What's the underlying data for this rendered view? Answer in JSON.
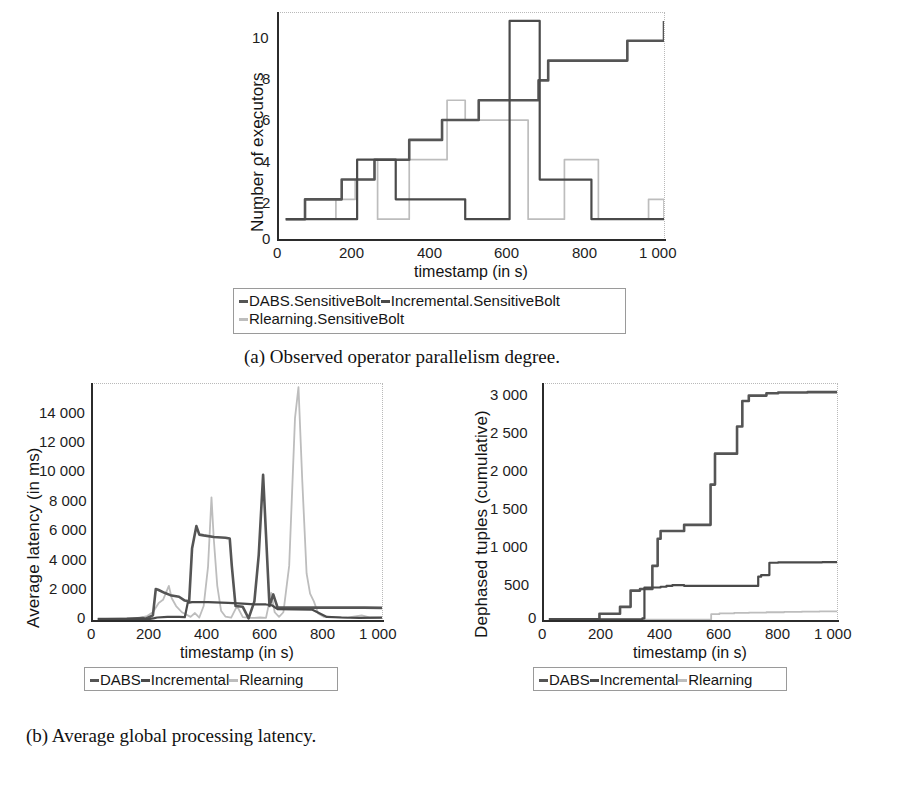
{
  "figure": {
    "panels": [
      {
        "id": "a",
        "caption": "(a) Observed operator parallelism degree.",
        "legend": [
          {
            "label": "DABS.SensitiveBolt",
            "color": "#555555"
          },
          {
            "label": "Incremental.SensitiveBolt",
            "color": "#4a4a4a"
          },
          {
            "label": "Rlearning.SensitiveBolt",
            "color": "#bdbdbd"
          }
        ]
      },
      {
        "id": "b",
        "caption": "(b) Average global processing latency.",
        "legend": [
          {
            "label": "DABS",
            "color": "#555555"
          },
          {
            "label": "Incremental",
            "color": "#4a4a4a"
          },
          {
            "label": "Rlearning",
            "color": "#bdbdbd"
          }
        ]
      },
      {
        "id": "c",
        "caption": "(c) Cumulated dephased tuples.",
        "legend": [
          {
            "label": "DABS",
            "color": "#555555"
          },
          {
            "label": "Incremental",
            "color": "#4a4a4a"
          },
          {
            "label": "Rlearning",
            "color": "#bdbdbd"
          }
        ]
      }
    ]
  },
  "chart_data": [
    {
      "panel": "a",
      "type": "line",
      "title": "",
      "xlabel": "timestamp (in s)",
      "ylabel": "Number of executors",
      "xlim": [
        0,
        1000
      ],
      "ylim": [
        0,
        11.4
      ],
      "xticks": [
        0,
        200,
        400,
        600,
        800,
        1000
      ],
      "xticklabels": [
        "0",
        "200",
        "400",
        "600",
        "800",
        "1 000"
      ],
      "yticks": [
        0,
        2,
        4,
        6,
        8,
        10
      ],
      "yticklabels": [
        "0",
        "2",
        "4",
        "6",
        "8",
        "10"
      ],
      "grid": false,
      "legend_position": "below-plot",
      "step": true,
      "series": [
        {
          "name": "DABS.SensitiveBolt",
          "color": "#555555",
          "x": [
            20,
            45,
            70,
            140,
            165,
            195,
            250,
            285,
            310,
            340,
            370,
            425,
            455,
            480,
            520,
            545,
            595,
            600,
            660,
            675,
            690,
            700,
            730,
            790,
            810,
            880,
            905,
            1000
          ],
          "y": [
            1,
            1,
            2,
            2,
            3,
            3,
            4,
            4,
            4,
            5,
            5,
            6,
            6,
            6,
            7,
            7,
            7,
            7,
            7,
            8,
            8,
            9,
            9,
            9,
            9,
            9,
            10,
            11
          ]
        },
        {
          "name": "Incremental.SensitiveBolt",
          "color": "#4a4a4a",
          "x": [
            20,
            200,
            205,
            255,
            260,
            300,
            305,
            480,
            485,
            595,
            600,
            672,
            678,
            700,
            800,
            812,
            1000
          ],
          "y": [
            1,
            1,
            4,
            4,
            4,
            4,
            2,
            2,
            1,
            1,
            11,
            11,
            3,
            3,
            3,
            1,
            1
          ]
        },
        {
          "name": "Rlearning.SensitiveBolt",
          "color": "#bdbdbd",
          "x": [
            20,
            115,
            150,
            195,
            200,
            225,
            250,
            258,
            330,
            340,
            430,
            438,
            478,
            485,
            545,
            552,
            640,
            648,
            735,
            742,
            822,
            830,
            940,
            960,
            985,
            1000
          ],
          "y": [
            1,
            1,
            2,
            2,
            3,
            3,
            4,
            1,
            1,
            4,
            4,
            7,
            7,
            6,
            6,
            6,
            6,
            1,
            1,
            4,
            4,
            1,
            1,
            2,
            2,
            1
          ]
        }
      ]
    },
    {
      "panel": "b",
      "type": "line",
      "title": "",
      "xlabel": "timestamp (in s)",
      "ylabel": "Average latency (in ms)",
      "xlim": [
        0,
        1000
      ],
      "ylim": [
        0,
        15200
      ],
      "xticks": [
        0,
        200,
        400,
        600,
        800,
        1000
      ],
      "xticklabels": [
        "0",
        "200",
        "400",
        "600",
        "800",
        "1 000"
      ],
      "yticks": [
        0,
        2000,
        4000,
        6000,
        8000,
        10000,
        12000,
        14000
      ],
      "yticklabels": [
        "0",
        "2 000",
        "4 000",
        "6 000",
        "8 000",
        "10 000",
        "12 000",
        "14 000"
      ],
      "grid": false,
      "legend_position": "below-plot",
      "series": [
        {
          "name": "DABS",
          "color": "#555555",
          "x": [
            20,
            120,
            175,
            185,
            210,
            220,
            228,
            250,
            270,
            300,
            320,
            335,
            345,
            360,
            370,
            385,
            420,
            460,
            475,
            482,
            495,
            520,
            540,
            560,
            575,
            590,
            600,
            612,
            625,
            640,
            700,
            780,
            860,
            940,
            1000
          ],
          "y": [
            60,
            70,
            120,
            80,
            300,
            2000,
            1950,
            1750,
            1600,
            1500,
            1250,
            1200,
            4600,
            6050,
            5500,
            5450,
            5350,
            5300,
            5250,
            3500,
            900,
            850,
            100,
            1200,
            4200,
            9350,
            5500,
            900,
            1650,
            800,
            800,
            800,
            800,
            800,
            780
          ]
        },
        {
          "name": "Incremental",
          "color": "#4a4a4a",
          "x": [
            20,
            150,
            200,
            215,
            225,
            260,
            300,
            320,
            330,
            345,
            400,
            470,
            520,
            560,
            600,
            620,
            640,
            700,
            760,
            810,
            860,
            920,
            1000
          ],
          "y": [
            50,
            60,
            70,
            120,
            160,
            200,
            200,
            180,
            1100,
            1150,
            1150,
            1100,
            1050,
            1000,
            1000,
            950,
            700,
            680,
            660,
            200,
            160,
            140,
            150
          ]
        },
        {
          "name": "Rlearning",
          "color": "#bdbdbd",
          "x": [
            20,
            100,
            160,
            190,
            210,
            230,
            245,
            265,
            275,
            290,
            310,
            340,
            355,
            370,
            385,
            400,
            412,
            420,
            432,
            445,
            460,
            480,
            500,
            520,
            545,
            560,
            580,
            600,
            618,
            630,
            645,
            660,
            680,
            700,
            712,
            725,
            740,
            752,
            765,
            780,
            800,
            840,
            880,
            930,
            960,
            1000
          ],
          "y": [
            60,
            100,
            120,
            250,
            500,
            1100,
            1300,
            2200,
            1400,
            900,
            500,
            200,
            450,
            160,
            900,
            3400,
            7900,
            5200,
            2200,
            600,
            220,
            150,
            900,
            180,
            140,
            140,
            160,
            140,
            1750,
            500,
            200,
            500,
            3500,
            13000,
            15000,
            9000,
            3000,
            1700,
            1200,
            420,
            200,
            180,
            160,
            300,
            160,
            150
          ]
        }
      ]
    },
    {
      "panel": "c",
      "type": "line",
      "title": "",
      "xlabel": "timestamp (in s)",
      "ylabel": "Dephased tuples (cumulative)",
      "xlim": [
        0,
        1000
      ],
      "ylim": [
        0,
        3050
      ],
      "xticks": [
        0,
        200,
        400,
        600,
        800,
        1000
      ],
      "xticklabels": [
        "0",
        "200",
        "400",
        "600",
        "800",
        "1 000"
      ],
      "yticks": [
        0,
        500,
        1000,
        1500,
        2000,
        2500,
        3000
      ],
      "yticklabels": [
        "0",
        "500",
        "1 000",
        "1 500",
        "2 000",
        "2 500",
        "3 000"
      ],
      "grid": false,
      "legend_position": "below-plot",
      "step": true,
      "series": [
        {
          "name": "DABS",
          "color": "#555555",
          "x": [
            20,
            185,
            192,
            255,
            262,
            290,
            298,
            320,
            330,
            360,
            372,
            390,
            400,
            470,
            480,
            560,
            570,
            585,
            650,
            660,
            678,
            700,
            760,
            800,
            900,
            1000
          ],
          "y": [
            10,
            10,
            80,
            80,
            170,
            170,
            380,
            380,
            400,
            400,
            700,
            1050,
            1150,
            1150,
            1230,
            1230,
            1750,
            2150,
            2150,
            2500,
            2830,
            2900,
            2930,
            2940,
            2945,
            2950
          ]
        },
        {
          "name": "Incremental",
          "color": "#4a4a4a",
          "x": [
            20,
            330,
            338,
            345,
            390,
            400,
            420,
            440,
            460,
            480,
            560,
            640,
            720,
            732,
            742,
            760,
            770,
            800,
            880,
            950,
            1000
          ],
          "y": [
            8,
            8,
            20,
            420,
            420,
            430,
            440,
            450,
            450,
            440,
            440,
            440,
            440,
            560,
            580,
            580,
            740,
            745,
            745,
            748,
            750
          ]
        },
        {
          "name": "Rlearning",
          "color": "#bdbdbd",
          "x": [
            20,
            400,
            500,
            560,
            572,
            600,
            650,
            700,
            760,
            820,
            880,
            940,
            1000
          ],
          "y": [
            3,
            3,
            4,
            4,
            75,
            85,
            92,
            96,
            100,
            104,
            108,
            112,
            118
          ]
        }
      ]
    }
  ]
}
